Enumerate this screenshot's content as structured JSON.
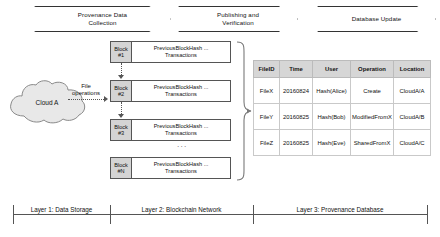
{
  "phases": [
    {
      "id": "provenance-data-collection",
      "line1": "Provenance Data",
      "line2": "Collection"
    },
    {
      "id": "publishing-and-verification",
      "line1": "Publishing and",
      "line2": "Verification"
    },
    {
      "id": "database-update",
      "line1": "Database Update",
      "line2": ""
    }
  ],
  "storage": {
    "cloud_label": "Cloud A",
    "file_operations_line1": "File",
    "file_operations_line2": "operations"
  },
  "blockchain": {
    "ellipsis": "···",
    "blocks": [
      {
        "tag_line1": "Block",
        "tag_line2": "#1",
        "body_line1": "PreviousBlockHash ...",
        "body_line2": "Transactions"
      },
      {
        "tag_line1": "Block",
        "tag_line2": "#2",
        "body_line1": "PreviousBlockHash ...",
        "body_line2": "Transactions"
      },
      {
        "tag_line1": "Block",
        "tag_line2": "#3",
        "body_line1": "PreviousBlockHash ...",
        "body_line2": "Transactions"
      },
      {
        "tag_line1": "Block",
        "tag_line2": "#N",
        "body_line1": "PreviousBlockHash ...",
        "body_line2": "Transactions"
      }
    ]
  },
  "provenance_table": {
    "headers": [
      "FileID",
      "Time",
      "User",
      "Operation",
      "Location"
    ],
    "rows": [
      [
        "FileX",
        "20160824",
        "Hash(Alice)",
        "Create",
        "CloudA/A"
      ],
      [
        "FileY",
        "20160825",
        "Hash(Bob)",
        "ModifiedFromX",
        "CloudA/B"
      ],
      [
        "FileZ",
        "20160825",
        "Hash(Eve)",
        "SharedFromX",
        "CloudA/C"
      ]
    ]
  },
  "layers": [
    {
      "label": "Layer 1: Data Storage"
    },
    {
      "label": "Layer 2: Blockchain Network"
    },
    {
      "label": "Layer 3: Provenance Database"
    }
  ],
  "colors": {
    "block_tag_fill": "#d4d4d4",
    "table_header_fill": "#d6d6d6",
    "stroke": "#555555",
    "cloud_fill": "#e8e8e8"
  }
}
